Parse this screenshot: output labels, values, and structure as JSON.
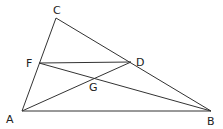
{
  "diagram": {
    "type": "geometry-triangle",
    "points": {
      "A": {
        "x": 22,
        "y": 111,
        "label": "A",
        "lx": 6,
        "ly": 123
      },
      "B": {
        "x": 211,
        "y": 111,
        "label": "B",
        "lx": 207,
        "ly": 125
      },
      "C": {
        "x": 56,
        "y": 18,
        "label": "C",
        "lx": 55,
        "ly": 14
      },
      "D": {
        "x": 131,
        "y": 62,
        "label": "D",
        "lx": 136,
        "ly": 65
      },
      "F": {
        "x": 39,
        "y": 63,
        "label": "F",
        "lx": 27,
        "ly": 67
      },
      "G": {
        "x": 92,
        "y": 78,
        "label": "G",
        "lx": 89,
        "ly": 92
      }
    },
    "segments": [
      "CA",
      "CB",
      "AB",
      "FD",
      "FB",
      "AD"
    ]
  }
}
